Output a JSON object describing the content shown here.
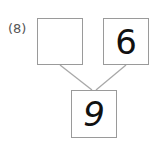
{
  "problem_label": "(8)",
  "number_bond": {
    "left_part": "",
    "right_part": "6",
    "whole": "9"
  }
}
